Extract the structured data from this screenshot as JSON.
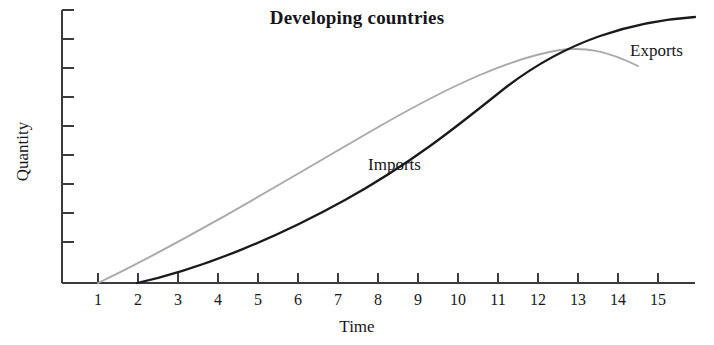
{
  "chart_data": {
    "type": "line",
    "title": "Developing countries",
    "xlabel": "Time",
    "ylabel": "Quantity",
    "xlim": [
      0,
      16
    ],
    "ylim": [
      0,
      10
    ],
    "grid": false,
    "legend_position": "inline-annotations",
    "x_tick_labels": [
      "1",
      "2",
      "3",
      "4",
      "5",
      "6",
      "7",
      "8",
      "9",
      "10",
      "11",
      "12",
      "13",
      "14",
      "15"
    ],
    "x": [
      1,
      2,
      3,
      4,
      5,
      6,
      7,
      8,
      9,
      10,
      11,
      12,
      13,
      14,
      15
    ],
    "y_tick_labels": [],
    "y_tick_count": 9,
    "series": [
      {
        "name": "Exports",
        "color": "#a9a9a9",
        "x": [
          1,
          2,
          3,
          4,
          5,
          6,
          7,
          8,
          9,
          10,
          11,
          12,
          13,
          13.6,
          14.5
        ],
        "values": [
          0.0,
          0.75,
          1.55,
          2.4,
          3.25,
          4.1,
          4.95,
          5.75,
          6.5,
          7.2,
          7.8,
          8.25,
          8.5,
          8.45,
          8.1
        ]
      },
      {
        "name": "Imports",
        "color": "#1a1a1e",
        "x": [
          2,
          3,
          4,
          5,
          6,
          7,
          8,
          9,
          10,
          11,
          12,
          13,
          14,
          15,
          16
        ],
        "values": [
          0.0,
          0.35,
          0.75,
          1.2,
          1.7,
          2.25,
          2.9,
          3.7,
          4.65,
          5.85,
          7.1,
          8.15,
          8.85,
          9.3,
          9.7
        ]
      }
    ],
    "annotations": [
      {
        "text": "Imports",
        "x": 9.7,
        "y": 4.7
      },
      {
        "text": "Exports",
        "x": 15.3,
        "y": 8.75
      }
    ]
  },
  "axes": {
    "title": "Developing countries",
    "x_title": "Time",
    "y_title": "Quantity"
  },
  "series_labels": {
    "imports": "Imports",
    "exports": "Exports"
  },
  "colors": {
    "exports": "#a9a9a9",
    "imports": "#1a1a1e",
    "axis": "#3a3a3f",
    "text": "#15161a",
    "background": "#ffffff"
  }
}
